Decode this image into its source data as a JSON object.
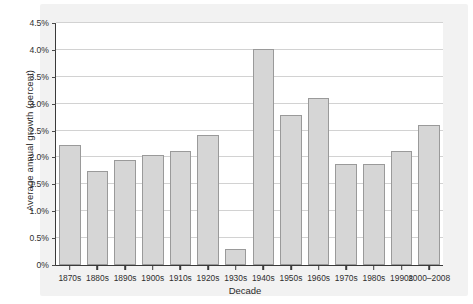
{
  "chart_data": {
    "type": "bar",
    "title": "",
    "xlabel": "Decade",
    "ylabel": "Average annual growth (percent)",
    "categories": [
      "1870s",
      "1880s",
      "1890s",
      "1900s",
      "1910s",
      "1920s",
      "1930s",
      "1940s",
      "1950s",
      "1960s",
      "1970s",
      "1980s",
      "1990s",
      "2000–2008"
    ],
    "values": [
      2.23,
      1.75,
      1.96,
      2.04,
      2.12,
      2.42,
      0.3,
      4.02,
      2.79,
      3.1,
      1.88,
      1.87,
      2.12,
      2.6
    ],
    "ylim": [
      0,
      4.5
    ],
    "ytick_labels": [
      "0%",
      "0.5%",
      "1.0%",
      "1.5%",
      "2.0%",
      "2.5%",
      "3.0%",
      "3.5%",
      "4.0%",
      "4.5%"
    ],
    "ytick_values": [
      0,
      0.5,
      1.0,
      1.5,
      2.0,
      2.5,
      3.0,
      3.5,
      4.0,
      4.5
    ],
    "grid": true,
    "legend": false,
    "bar_color": "#d6d6d6",
    "bar_border_color": "#9a9a9a",
    "axis_color": "#3a3a3a",
    "grid_color": "#d2d2d2"
  }
}
